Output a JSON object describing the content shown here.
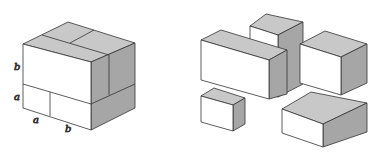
{
  "colors": {
    "background": "#ffffff",
    "front": "#ffffff",
    "top": "#c8c8c8",
    "side": "#a6a6a6",
    "stroke": "#333333"
  },
  "assembled_cube": {
    "labels": {
      "left_upper": "b",
      "left_lower": "a",
      "bottom_left": "a",
      "bottom_right": "b"
    }
  },
  "exploded_pieces": [
    {
      "name": "long-box",
      "description": "a × b × b block"
    },
    {
      "name": "tall-box",
      "description": "a × a × b block"
    },
    {
      "name": "large-cube",
      "description": "b × b × b cube"
    },
    {
      "name": "small-cube",
      "description": "a × a × a cube"
    },
    {
      "name": "flat-box",
      "description": "b × b × a block"
    }
  ]
}
